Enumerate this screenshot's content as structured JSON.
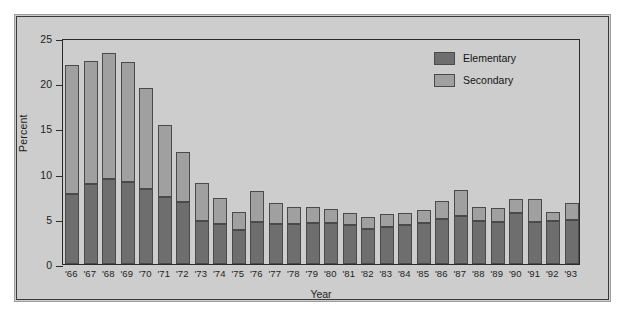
{
  "chart_data": {
    "type": "bar",
    "title": "",
    "subtitle": "",
    "xlabel": "Year",
    "ylabel": "Percent",
    "stacked": true,
    "grid": false,
    "legend_position": "top-right",
    "ylim": [
      0,
      25
    ],
    "yticks": [
      0,
      5,
      10,
      15,
      20,
      25
    ],
    "ytick_labels": [
      "0",
      "5",
      "10",
      "15",
      "20",
      "25"
    ],
    "categories": [
      "'66",
      "'67",
      "'68",
      "'69",
      "'70",
      "'71",
      "'72",
      "'73",
      "'74",
      "'75",
      "'76",
      "'77",
      "'78",
      "'79",
      "'80",
      "'81",
      "'82",
      "'83",
      "'84",
      "'85",
      "'86",
      "'87",
      "'88",
      "'89",
      "'90",
      "'91",
      "'92",
      "'93"
    ],
    "series": [
      {
        "name": "Elementary",
        "color": "#6e6e6e",
        "values": [
          7.7,
          8.8,
          9.4,
          9.1,
          8.3,
          7.4,
          6.9,
          4.8,
          4.4,
          3.8,
          4.7,
          4.4,
          4.4,
          4.5,
          4.5,
          4.3,
          3.9,
          4.1,
          4.3,
          4.5,
          5.0,
          5.3,
          4.8,
          4.6,
          5.6,
          4.7,
          4.8,
          4.9
        ]
      },
      {
        "name": "Secondary",
        "color": "#a0a0a0",
        "values": [
          14.3,
          13.7,
          13.9,
          13.3,
          11.2,
          8.0,
          5.5,
          4.2,
          2.9,
          2.0,
          3.4,
          2.4,
          1.9,
          1.8,
          1.6,
          1.4,
          1.3,
          1.4,
          1.3,
          1.5,
          2.0,
          2.9,
          1.5,
          1.6,
          1.6,
          2.5,
          0.9,
          1.8
        ]
      }
    ],
    "totals": [
      22.0,
      22.5,
      23.3,
      22.4,
      19.5,
      15.4,
      12.4,
      9.0,
      7.3,
      5.8,
      8.1,
      6.8,
      6.3,
      6.3,
      6.1,
      5.7,
      5.2,
      5.5,
      5.6,
      6.0,
      7.0,
      8.2,
      6.3,
      6.2,
      7.2,
      7.2,
      5.7,
      6.7
    ]
  },
  "legend": {
    "items": [
      {
        "label": "Elementary",
        "color": "#6e6e6e"
      },
      {
        "label": "Secondary",
        "color": "#a0a0a0"
      }
    ]
  },
  "axes": {
    "y_title": "Percent",
    "x_title": "Year"
  }
}
